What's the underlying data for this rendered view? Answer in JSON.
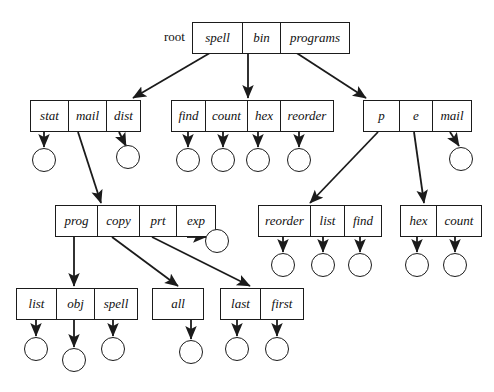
{
  "diagram": {
    "root_label": "root",
    "stroke_color": "#1b1b1b",
    "background": "#ffffff",
    "nodes": [
      {
        "id": "root",
        "x": 192,
        "y": 22,
        "cells": [
          {
            "label": "spell",
            "w": 50
          },
          {
            "label": "bin",
            "w": 38
          },
          {
            "label": "programs",
            "w": 68
          }
        ]
      },
      {
        "id": "spell-dir",
        "x": 30,
        "y": 100,
        "cells": [
          {
            "label": "stat",
            "w": 38
          },
          {
            "label": "mail",
            "w": 38
          },
          {
            "label": "dist",
            "w": 33
          }
        ]
      },
      {
        "id": "bin-dir",
        "x": 171,
        "y": 100,
        "cells": [
          {
            "label": "find",
            "w": 34
          },
          {
            "label": "count",
            "w": 42
          },
          {
            "label": "hex",
            "w": 33
          },
          {
            "label": "reorder",
            "w": 52
          }
        ]
      },
      {
        "id": "programs-dir",
        "x": 363,
        "y": 100,
        "cells": [
          {
            "label": "p",
            "w": 36
          },
          {
            "label": "e",
            "w": 33
          },
          {
            "label": "mail",
            "w": 38
          }
        ]
      },
      {
        "id": "mail-dir",
        "x": 55,
        "y": 205,
        "cells": [
          {
            "label": "prog",
            "w": 42
          },
          {
            "label": "copy",
            "w": 42
          },
          {
            "label": "prt",
            "w": 37
          },
          {
            "label": "exp",
            "w": 38
          }
        ]
      },
      {
        "id": "p-dir",
        "x": 258,
        "y": 205,
        "cells": [
          {
            "label": "reorder",
            "w": 52
          },
          {
            "label": "list",
            "w": 34
          },
          {
            "label": "find",
            "w": 36
          }
        ]
      },
      {
        "id": "e-dir",
        "x": 400,
        "y": 205,
        "cells": [
          {
            "label": "hex",
            "w": 36
          },
          {
            "label": "count",
            "w": 44
          }
        ]
      },
      {
        "id": "prog-dir",
        "x": 16,
        "y": 288,
        "cells": [
          {
            "label": "list",
            "w": 40
          },
          {
            "label": "obj",
            "w": 38
          },
          {
            "label": "spell",
            "w": 42
          }
        ]
      },
      {
        "id": "copy-dir",
        "x": 152,
        "y": 288,
        "cells": [
          {
            "label": "all",
            "w": 50
          }
        ]
      },
      {
        "id": "prt-dir",
        "x": 220,
        "y": 288,
        "cells": [
          {
            "label": "last",
            "w": 40
          },
          {
            "label": "first",
            "w": 42
          }
        ]
      }
    ],
    "nils": [
      {
        "id": "nil-stat",
        "cx": 44,
        "cy": 160,
        "r": 12
      },
      {
        "id": "nil-dist",
        "cx": 128,
        "cy": 157,
        "r": 12
      },
      {
        "id": "nil-find1",
        "cx": 188,
        "cy": 160,
        "r": 12
      },
      {
        "id": "nil-count1",
        "cx": 223,
        "cy": 160,
        "r": 12
      },
      {
        "id": "nil-hex1",
        "cx": 258,
        "cy": 160,
        "r": 12
      },
      {
        "id": "nil-reorder1",
        "cx": 299,
        "cy": 160,
        "r": 12
      },
      {
        "id": "nil-mail2",
        "cx": 461,
        "cy": 159,
        "r": 12
      },
      {
        "id": "nil-exp",
        "cx": 217,
        "cy": 241,
        "r": 12
      },
      {
        "id": "nil-reorder2",
        "cx": 283,
        "cy": 265,
        "r": 12
      },
      {
        "id": "nil-list2",
        "cx": 323,
        "cy": 265,
        "r": 12
      },
      {
        "id": "nil-find2",
        "cx": 360,
        "cy": 265,
        "r": 12
      },
      {
        "id": "nil-hex2",
        "cx": 417,
        "cy": 265,
        "r": 12
      },
      {
        "id": "nil-count2",
        "cx": 455,
        "cy": 265,
        "r": 12
      },
      {
        "id": "nil-list3",
        "cx": 36,
        "cy": 349,
        "r": 12
      },
      {
        "id": "nil-obj",
        "cx": 74,
        "cy": 360,
        "r": 12
      },
      {
        "id": "nil-spell2",
        "cx": 113,
        "cy": 349,
        "r": 12
      },
      {
        "id": "nil-all",
        "cx": 191,
        "cy": 352,
        "r": 12
      },
      {
        "id": "nil-last",
        "cx": 237,
        "cy": 349,
        "r": 12
      },
      {
        "id": "nil-first",
        "cx": 277,
        "cy": 349,
        "r": 12
      }
    ],
    "edges": [
      {
        "from": "root.spell",
        "to": "spell-dir",
        "x1": 215,
        "y1": 50,
        "x2": 133,
        "y2": 98
      },
      {
        "from": "root.bin",
        "to": "bin-dir",
        "x1": 248,
        "y1": 50,
        "x2": 248,
        "y2": 98
      },
      {
        "from": "root.programs",
        "to": "programs-dir",
        "x1": 292,
        "y1": 50,
        "x2": 366,
        "y2": 98
      },
      {
        "from": "spell-dir.stat",
        "to": "nil-stat",
        "x1": 44,
        "y1": 132,
        "x2": 44,
        "y2": 147
      },
      {
        "from": "spell-dir.dist",
        "to": "nil-dist",
        "x1": 119,
        "y1": 132,
        "x2": 126,
        "y2": 146
      },
      {
        "from": "spell-dir.mail",
        "to": "mail-dir",
        "x1": 78,
        "y1": 132,
        "x2": 101,
        "y2": 203
      },
      {
        "from": "bin-dir.find",
        "to": "nil-find1",
        "x1": 188,
        "y1": 132,
        "x2": 188,
        "y2": 147
      },
      {
        "from": "bin-dir.count",
        "to": "nil-count1",
        "x1": 223,
        "y1": 132,
        "x2": 223,
        "y2": 147
      },
      {
        "from": "bin-dir.hex",
        "to": "nil-hex1",
        "x1": 258,
        "y1": 132,
        "x2": 258,
        "y2": 147
      },
      {
        "from": "bin-dir.reorder",
        "to": "nil-reorder1",
        "x1": 299,
        "y1": 132,
        "x2": 299,
        "y2": 147
      },
      {
        "from": "programs-dir.p",
        "to": "p-dir",
        "x1": 378,
        "y1": 132,
        "x2": 310,
        "y2": 203
      },
      {
        "from": "programs-dir.e",
        "to": "e-dir",
        "x1": 414,
        "y1": 132,
        "x2": 424,
        "y2": 203
      },
      {
        "from": "programs-dir.mail",
        "to": "nil-mail2",
        "x1": 450,
        "y1": 132,
        "x2": 459,
        "y2": 146
      },
      {
        "from": "mail-dir.prog",
        "to": "prog-dir",
        "x1": 74,
        "y1": 237,
        "x2": 74,
        "y2": 286
      },
      {
        "from": "mail-dir.copy",
        "to": "copy-dir",
        "x1": 112,
        "y1": 237,
        "x2": 178,
        "y2": 286
      },
      {
        "from": "mail-dir.prt",
        "to": "prt-dir",
        "x1": 152,
        "y1": 237,
        "x2": 250,
        "y2": 286
      },
      {
        "from": "mail-dir.exp",
        "to": "nil-exp",
        "x1": 187,
        "y1": 237,
        "x2": 206,
        "y2": 237
      },
      {
        "from": "p-dir.reorder",
        "to": "nil-reorder2",
        "x1": 283,
        "y1": 237,
        "x2": 283,
        "y2": 252
      },
      {
        "from": "p-dir.list",
        "to": "nil-list2",
        "x1": 323,
        "y1": 237,
        "x2": 323,
        "y2": 252
      },
      {
        "from": "p-dir.find",
        "to": "nil-find2",
        "x1": 360,
        "y1": 237,
        "x2": 360,
        "y2": 252
      },
      {
        "from": "e-dir.hex",
        "to": "nil-hex2",
        "x1": 417,
        "y1": 237,
        "x2": 417,
        "y2": 252
      },
      {
        "from": "e-dir.count",
        "to": "nil-count2",
        "x1": 455,
        "y1": 237,
        "x2": 455,
        "y2": 252
      },
      {
        "from": "prog-dir.list",
        "to": "nil-list3",
        "x1": 36,
        "y1": 320,
        "x2": 36,
        "y2": 336
      },
      {
        "from": "prog-dir.obj",
        "to": "nil-obj",
        "x1": 74,
        "y1": 320,
        "x2": 74,
        "y2": 347
      },
      {
        "from": "prog-dir.spell",
        "to": "nil-spell2",
        "x1": 113,
        "y1": 320,
        "x2": 113,
        "y2": 336
      },
      {
        "from": "copy-dir.all",
        "to": "nil-all",
        "x1": 191,
        "y1": 320,
        "x2": 191,
        "y2": 339
      },
      {
        "from": "prt-dir.last",
        "to": "nil-last",
        "x1": 237,
        "y1": 320,
        "x2": 237,
        "y2": 336
      },
      {
        "from": "prt-dir.first",
        "to": "nil-first",
        "x1": 277,
        "y1": 320,
        "x2": 277,
        "y2": 336
      }
    ]
  }
}
